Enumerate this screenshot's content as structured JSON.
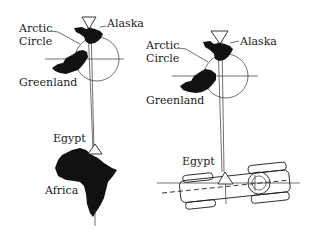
{
  "left_panel": {
    "labels": {
      "alaska": "Alaska",
      "arctic_circle_line1": "Arctic",
      "arctic_circle_line2": "Circle",
      "greenland": "Greenland",
      "egypt": "Egypt",
      "africa": "Africa"
    }
  },
  "right_panel": {
    "labels": {
      "alaska": "Alaska",
      "arctic_circle_line1": "Arctic",
      "arctic_circle_line2": "Circle",
      "greenland": "Greenland",
      "egypt": "Egypt"
    }
  },
  "colors": {
    "ink": "#111111",
    "background": "#ffffff"
  }
}
